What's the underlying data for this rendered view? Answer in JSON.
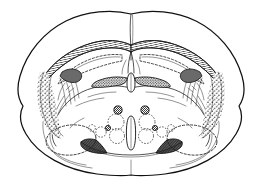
{
  "figure": {
    "type": "line-drawing",
    "background_color": "#ffffff",
    "ink_color": "#111111",
    "width": 262,
    "height": 177,
    "caption": ""
  },
  "structures": {
    "outer_cortex": {
      "name": "cerebral cortex outline",
      "style": "solid outline",
      "notch_label": "rhinal fissure notch"
    },
    "corpus_callosum": {
      "name": "corpus callosum",
      "style": "cross-hatched band",
      "color": "#111111"
    },
    "lateral_ventricle_left": {
      "name": "left lateral ventricle",
      "style": "dashed outline"
    },
    "lateral_ventricle_right": {
      "name": "right lateral ventricle",
      "style": "dashed outline"
    },
    "third_ventricle": {
      "name": "third ventricle",
      "style": "white elongated slit"
    },
    "anterior_commissure": {
      "name": "anterior commissure / fornix bundle",
      "style": "dark stippled wedge"
    },
    "optic_tract_left": {
      "name": "left optic tract",
      "style": "dark hatched wedge"
    },
    "optic_tract_right": {
      "name": "right optic tract",
      "style": "dark hatched wedge"
    },
    "striatum_left": {
      "name": "left caudate-putamen fiber field",
      "style": "stippled dots"
    },
    "striatum_right": {
      "name": "right caudate-putamen fiber field",
      "style": "stippled dots"
    },
    "amygdala_left": {
      "name": "left amygdaloid complex",
      "style": "large dashed oval"
    },
    "amygdala_right": {
      "name": "right amygdaloid complex",
      "style": "large dashed oval"
    },
    "hypothalamic_nuclei": {
      "name": "hypothalamic nuclei cluster",
      "style": "dashed circles with stippled filled circles",
      "dashed_circle_count": 8,
      "filled_circle_count": 4
    }
  },
  "annotations": {
    "labels": [],
    "scale_bar": ""
  }
}
